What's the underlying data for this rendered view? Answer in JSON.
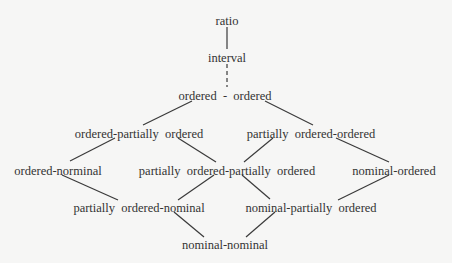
{
  "diagram": {
    "type": "lattice",
    "nodes": [
      {
        "id": "ratio",
        "label": "ratio",
        "x": 227,
        "y": 14
      },
      {
        "id": "interval",
        "label": "interval",
        "x": 227,
        "y": 51
      },
      {
        "id": "ord_ord",
        "label": "ordered  -  ordered",
        "x": 225,
        "y": 89
      },
      {
        "id": "ord_pord",
        "label": "ordered-partially  ordered",
        "x": 139,
        "y": 127
      },
      {
        "id": "pord_ord",
        "label": "partially  ordered-ordered",
        "x": 311,
        "y": 127
      },
      {
        "id": "ord_nom",
        "label": "ordered-norminal",
        "x": 58,
        "y": 164
      },
      {
        "id": "pord_pord",
        "label": "partially  ordered-partially  ordered",
        "x": 227,
        "y": 164
      },
      {
        "id": "nom_ord",
        "label": "nominal-ordered",
        "x": 394,
        "y": 164
      },
      {
        "id": "pord_nom",
        "label": "partially  ordered-nominal",
        "x": 139,
        "y": 201
      },
      {
        "id": "nom_pord",
        "label": "nominal-partially  ordered",
        "x": 311,
        "y": 201
      },
      {
        "id": "nom_nom",
        "label": "nominal-nominal",
        "x": 225,
        "y": 238
      }
    ],
    "edges": [
      {
        "from": "ratio",
        "to": "interval",
        "style": "solid",
        "x1": 227,
        "y1": 27,
        "x2": 227,
        "y2": 49
      },
      {
        "from": "interval",
        "to": "ord_ord",
        "style": "dashed",
        "x1": 227,
        "y1": 64,
        "x2": 227,
        "y2": 87
      },
      {
        "from": "ord_ord",
        "to": "ord_pord",
        "style": "solid",
        "x1": 192,
        "y1": 101,
        "x2": 143,
        "y2": 125
      },
      {
        "from": "ord_ord",
        "to": "pord_ord",
        "style": "solid",
        "x1": 265,
        "y1": 101,
        "x2": 313,
        "y2": 125
      },
      {
        "from": "ord_pord",
        "to": "ord_nom",
        "style": "solid",
        "x1": 115,
        "y1": 138,
        "x2": 70,
        "y2": 161
      },
      {
        "from": "ord_pord",
        "to": "pord_pord",
        "style": "solid",
        "x1": 178,
        "y1": 138,
        "x2": 216,
        "y2": 162
      },
      {
        "from": "pord_ord",
        "to": "pord_pord",
        "style": "solid",
        "x1": 273,
        "y1": 138,
        "x2": 244,
        "y2": 162
      },
      {
        "from": "pord_ord",
        "to": "nom_ord",
        "style": "solid",
        "x1": 336,
        "y1": 138,
        "x2": 389,
        "y2": 162
      },
      {
        "from": "ord_nom",
        "to": "pord_nom",
        "style": "solid",
        "x1": 62,
        "y1": 175,
        "x2": 118,
        "y2": 200
      },
      {
        "from": "pord_pord",
        "to": "pord_nom",
        "style": "solid",
        "x1": 214,
        "y1": 175,
        "x2": 178,
        "y2": 200
      },
      {
        "from": "pord_pord",
        "to": "nom_pord",
        "style": "solid",
        "x1": 242,
        "y1": 175,
        "x2": 270,
        "y2": 199
      },
      {
        "from": "nom_ord",
        "to": "nom_pord",
        "style": "solid",
        "x1": 389,
        "y1": 175,
        "x2": 338,
        "y2": 200
      },
      {
        "from": "pord_nom",
        "to": "nom_nom",
        "style": "solid",
        "x1": 174,
        "y1": 212,
        "x2": 204,
        "y2": 237
      },
      {
        "from": "nom_pord",
        "to": "nom_nom",
        "style": "solid",
        "x1": 275,
        "y1": 212,
        "x2": 246,
        "y2": 237
      }
    ],
    "colors": {
      "background": "#f6f6f5",
      "text": "#333333",
      "line": "#3a3a3a"
    }
  }
}
